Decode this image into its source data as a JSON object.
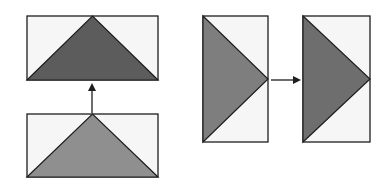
{
  "diagram": {
    "colors": {
      "background": "#ffffff",
      "rect_fill": "#f6f6f6",
      "stroke": "#1e1e1e",
      "triangle_dark": "#5c5c5c",
      "triangle_light": "#8f8f8f",
      "triangle_mid_left": "#7e7e7e",
      "triangle_mid_right": "#6e6e6e"
    },
    "panels": [
      {
        "id": "top-left-rect",
        "x": 27,
        "y": 16,
        "w": 131,
        "h": 64,
        "triangle": "up",
        "fill_key": "triangle_dark"
      },
      {
        "id": "bottom-left-rect",
        "x": 27,
        "y": 114,
        "w": 131,
        "h": 63,
        "triangle": "up",
        "fill_key": "triangle_light"
      },
      {
        "id": "right-first-rect",
        "x": 203,
        "y": 16,
        "w": 65,
        "h": 126,
        "triangle": "right",
        "fill_key": "triangle_mid_left"
      },
      {
        "id": "right-second-rect",
        "x": 303,
        "y": 16,
        "w": 67,
        "h": 126,
        "triangle": "right",
        "fill_key": "triangle_mid_right"
      }
    ],
    "arrows": [
      {
        "id": "up-arrow",
        "x1": 92,
        "y1": 113,
        "x2": 92,
        "y2": 85,
        "direction": "up"
      },
      {
        "id": "right-arrow",
        "x1": 271,
        "y1": 80,
        "x2": 299,
        "y2": 80,
        "direction": "right"
      }
    ]
  }
}
